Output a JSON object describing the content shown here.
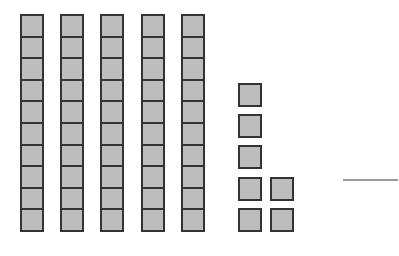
{
  "diagram": {
    "type": "base-ten-blocks",
    "colors": {
      "block_fill": "#bdbdbd",
      "block_border": "#333333",
      "answer_line": "#9a9a9a",
      "background": "#ffffff"
    },
    "tens": {
      "count": 5,
      "cubes_per_rod": 10
    },
    "ones": {
      "count": 7
    },
    "answer_blank": ""
  }
}
